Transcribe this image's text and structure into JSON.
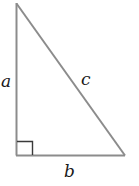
{
  "diagram": {
    "type": "right-triangle",
    "stroke_color": "#8c8c8c",
    "square_color": "#3a3a3a",
    "label_color": "#1a1a1a",
    "vertices": {
      "top": [
        16.5,
        3
      ],
      "right_angle": [
        16.5,
        155
      ],
      "bottom_right": [
        125,
        155
      ]
    },
    "labels": {
      "a": "a",
      "b": "b",
      "c": "c"
    },
    "right_angle_marker": true
  }
}
